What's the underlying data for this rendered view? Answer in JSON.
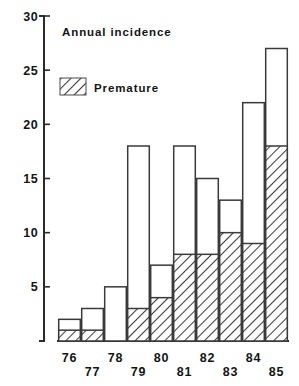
{
  "chart_data": {
    "type": "bar",
    "title": "Annual incidence",
    "xlabel": "",
    "ylabel": "",
    "ylim": [
      0,
      30
    ],
    "yticks": [
      0,
      5,
      10,
      15,
      20,
      25,
      30
    ],
    "ytick_labels": [
      "",
      "5",
      "10",
      "15",
      "20",
      "25",
      "30"
    ],
    "grid": false,
    "stacked": true,
    "legend_position": "upper-left-inside",
    "categories": [
      "76",
      "77",
      "78",
      "79",
      "80",
      "81",
      "82",
      "83",
      "84",
      "85"
    ],
    "series": [
      {
        "name": "Total",
        "style": "open",
        "values": [
          2,
          3,
          5,
          18,
          7,
          18,
          15,
          13,
          22,
          27
        ]
      },
      {
        "name": "Premature",
        "style": "hatched",
        "values": [
          1,
          1,
          0,
          3,
          4,
          8,
          8,
          10,
          9,
          18
        ]
      }
    ],
    "legend_entries": [
      {
        "label": "Premature",
        "style": "hatched"
      }
    ],
    "annotations": [
      {
        "text": "Annual incidence",
        "position": "top-left-inside"
      }
    ]
  },
  "figure": {
    "title": "Annual incidence",
    "legend_label": "Premature",
    "y_axis": {
      "ticks": [
        {
          "value": 30,
          "label": "30"
        },
        {
          "value": 25,
          "label": "25"
        },
        {
          "value": 20,
          "label": "20"
        },
        {
          "value": 15,
          "label": "15"
        },
        {
          "value": 10,
          "label": "10"
        },
        {
          "value": 5,
          "label": "5"
        }
      ]
    },
    "x_axis": {
      "labels_top_row": [
        "76",
        "78",
        "80",
        "82",
        "84"
      ],
      "labels_bottom_row": [
        "77",
        "79",
        "81",
        "83",
        "85"
      ]
    },
    "colors": {
      "ink": "#2b2b2b",
      "bar_stroke": "#3a3a3a",
      "bar_fill": "#ffffff",
      "background": "#ffffff"
    }
  }
}
